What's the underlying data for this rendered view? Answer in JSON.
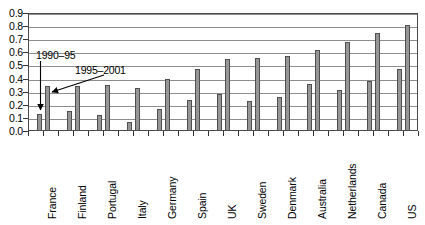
{
  "chart_data": {
    "type": "bar",
    "title": "",
    "xlabel": "",
    "ylabel": "",
    "ylim": [
      0.0,
      0.9
    ],
    "ytick_step": 0.1,
    "grid": true,
    "legend_position": "annotated-arrows",
    "categories": [
      "France",
      "Finland",
      "Portugal",
      "Italy",
      "Germany",
      "Spain",
      "UK",
      "Sweden",
      "Denmark",
      "Australia",
      "Netherlands",
      "Canada",
      "US"
    ],
    "series": [
      {
        "name": "1990–95",
        "values": [
          0.13,
          0.15,
          0.12,
          0.07,
          0.17,
          0.24,
          0.28,
          0.23,
          0.26,
          0.36,
          0.31,
          0.38,
          0.47
        ]
      },
      {
        "name": "1995–2001",
        "values": [
          0.34,
          0.34,
          0.35,
          0.33,
          0.4,
          0.47,
          0.55,
          0.56,
          0.57,
          0.62,
          0.68,
          0.75,
          0.81
        ]
      }
    ],
    "ytick_labels": [
      "0.0",
      "0.1",
      "0.2",
      "0.3",
      "0.4",
      "0.5",
      "0.6",
      "0.7",
      "0.8",
      "0.9"
    ],
    "annotations": [
      {
        "text": "1990–95",
        "points_to": "France 1990-95 bar"
      },
      {
        "text": "1995–2001",
        "points_to": "France 1995-2001 bar"
      }
    ]
  }
}
